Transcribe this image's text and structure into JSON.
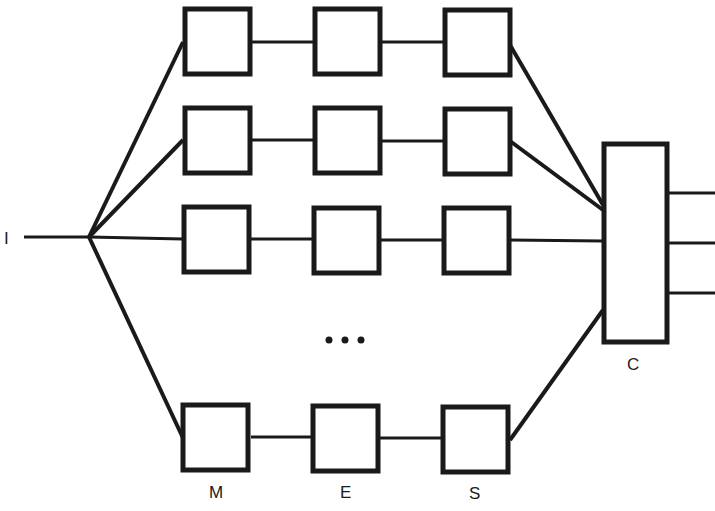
{
  "diagram": {
    "input_label": "I",
    "combiner_label": "C",
    "column_labels": [
      "M",
      "E",
      "S"
    ],
    "ellipsis": "• • •",
    "rows": 4,
    "outputs": 3,
    "colors": {
      "stroke": "#1a1a1a",
      "fill": "#ffffff"
    }
  }
}
